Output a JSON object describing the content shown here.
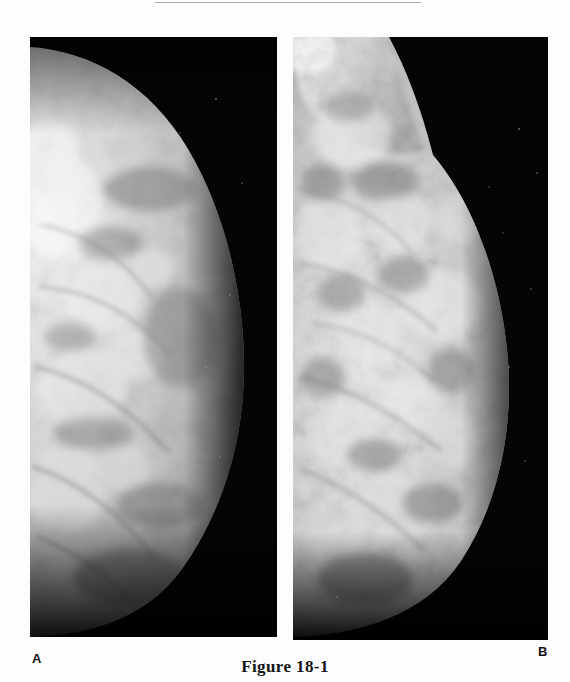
{
  "page": {
    "background_color": "#fdfdfd",
    "width": 570,
    "height": 682
  },
  "top_rule": {
    "color": "#a8a8a8"
  },
  "caption": {
    "text": "Figure 18-1"
  },
  "panels": [
    {
      "letter": "A",
      "name": "mammogram-craniocaudal",
      "description": "Craniocaudal mammogram, breast tissue at left fading to black background at right",
      "background_color": "#040404",
      "tissue_color": "#d8d8d8",
      "bright_color": "#f2f2f2"
    },
    {
      "letter": "B",
      "name": "mammogram-mediolateral-oblique",
      "description": "Mediolateral oblique mammogram with pectoral muscle band at upper left and dense nodular glandular tissue",
      "background_color": "#040404",
      "tissue_color": "#cfcfcf",
      "bright_color": "#efefef"
    }
  ]
}
